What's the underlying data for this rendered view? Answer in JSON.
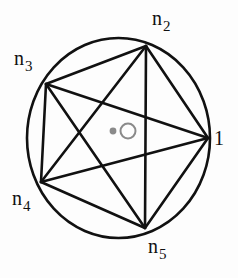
{
  "figure": {
    "title": "",
    "type": "graph-diagram",
    "background_color": "#fdfdfd",
    "stroke_color": "#111111",
    "circle": {
      "name": "circumscribing-circle",
      "center_x": 118.5,
      "center_y": 138,
      "radius_x": 91.5,
      "radius_y": 100,
      "stroke_width": 2.6
    },
    "vertices": [
      {
        "id": "v1",
        "label_base": "1",
        "label_sub": "",
        "x": 208,
        "y": 138,
        "label_x": 214,
        "label_y": 128
      },
      {
        "id": "v2",
        "label_base": "n",
        "label_sub": "2",
        "x": 146,
        "y": 46,
        "label_x": 152,
        "label_y": 8
      },
      {
        "id": "v3",
        "label_base": "n",
        "label_sub": "3",
        "x": 46,
        "y": 84,
        "label_x": 14,
        "label_y": 48
      },
      {
        "id": "v4",
        "label_base": "n",
        "label_sub": "4",
        "x": 41,
        "y": 182,
        "label_x": 12,
        "label_y": 188
      },
      {
        "id": "v5",
        "label_base": "n",
        "label_sub": "5",
        "x": 145,
        "y": 228,
        "label_x": 148,
        "label_y": 236
      }
    ],
    "edges": [
      {
        "from": "v1",
        "to": "v2",
        "name": "edge-1-n2"
      },
      {
        "from": "v1",
        "to": "v3",
        "name": "edge-1-n3"
      },
      {
        "from": "v1",
        "to": "v4",
        "name": "edge-1-n4"
      },
      {
        "from": "v1",
        "to": "v5",
        "name": "edge-1-n5"
      },
      {
        "from": "v2",
        "to": "v3",
        "name": "edge-n2-n3"
      },
      {
        "from": "v2",
        "to": "v4",
        "name": "edge-n2-n4"
      },
      {
        "from": "v2",
        "to": "v5",
        "name": "edge-n2-n5"
      },
      {
        "from": "v3",
        "to": "v4",
        "name": "edge-n3-n4"
      },
      {
        "from": "v3",
        "to": "v5",
        "name": "edge-n3-n5"
      },
      {
        "from": "v4",
        "to": "v5",
        "name": "edge-n4-n5"
      }
    ],
    "edge_stroke_width": 2.6,
    "center_markers": {
      "dot": {
        "name": "center-filled-dot",
        "x": 113,
        "y": 131,
        "radius": 3.4,
        "color": "#8a8a8a"
      },
      "ring": {
        "name": "center-open-circle",
        "x": 128,
        "y": 131,
        "radius": 7.5,
        "color": "#8a8a8a",
        "stroke_width": 2.0
      }
    }
  }
}
